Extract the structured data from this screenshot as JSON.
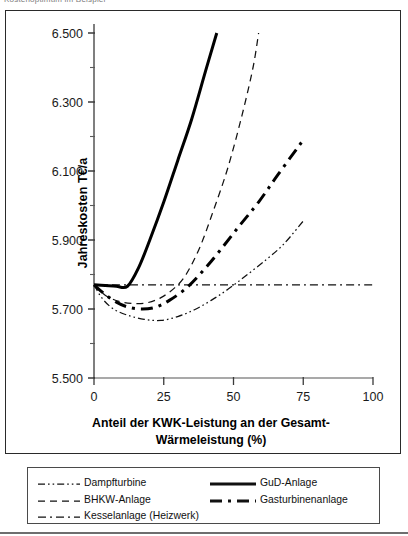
{
  "page": {
    "top_fragment": "Kostenoptimum im Beispiel"
  },
  "chart_data": {
    "type": "line",
    "title": "",
    "xlabel_line1": "Anteil der KWK-Leistung an der Gesamt-",
    "xlabel_line2": "Wärmeleistung (%)",
    "ylabel": "Jahreskosten T€/a",
    "xlim": [
      0,
      100
    ],
    "ylim": [
      5500,
      6500
    ],
    "xticks": [
      0,
      25,
      50,
      75,
      100
    ],
    "xtick_labels": [
      "0",
      "25",
      "50",
      "75",
      "100"
    ],
    "yticks": [
      5500,
      5700,
      5900,
      6100,
      6300,
      6500
    ],
    "ytick_labels": [
      "5.500",
      "5.700",
      "5.900",
      "6.100",
      "6.300",
      "6.500"
    ],
    "yticks_minor": [
      5600,
      5800,
      6000,
      6200,
      6400
    ],
    "grid": false,
    "legend_position": "below-plot",
    "series": [
      {
        "name": "Dampfturbine",
        "style": "dash-dot-dot",
        "width": "thin",
        "color": "#111111",
        "points": [
          [
            0,
            5770
          ],
          [
            3,
            5730
          ],
          [
            7,
            5700
          ],
          [
            12,
            5682
          ],
          [
            18,
            5670
          ],
          [
            24,
            5667
          ],
          [
            30,
            5678
          ],
          [
            36,
            5698
          ],
          [
            42,
            5725
          ],
          [
            48,
            5757
          ],
          [
            55,
            5800
          ],
          [
            62,
            5845
          ],
          [
            68,
            5888
          ],
          [
            75,
            5955
          ]
        ]
      },
      {
        "name": "BHKW-Anlage",
        "style": "dashed",
        "width": "thin",
        "color": "#111111",
        "points": [
          [
            0,
            5770
          ],
          [
            4,
            5740
          ],
          [
            9,
            5722
          ],
          [
            14,
            5716
          ],
          [
            19,
            5718
          ],
          [
            24,
            5733
          ],
          [
            29,
            5762
          ],
          [
            33,
            5800
          ],
          [
            38,
            5880
          ],
          [
            43,
            5990
          ],
          [
            48,
            6110
          ],
          [
            53,
            6260
          ],
          [
            57,
            6400
          ],
          [
            59,
            6500
          ]
        ]
      },
      {
        "name": "Kesselanlage (Heizwerk)",
        "style": "dash-dot",
        "width": "thin",
        "color": "#111111",
        "points": [
          [
            0,
            5770
          ],
          [
            25,
            5770
          ],
          [
            50,
            5770
          ],
          [
            75,
            5770
          ],
          [
            100,
            5770
          ]
        ]
      },
      {
        "name": "GuD-Anlage",
        "style": "solid",
        "width": "thick",
        "color": "#000000",
        "points": [
          [
            0,
            5770
          ],
          [
            4,
            5768
          ],
          [
            8,
            5766
          ],
          [
            12,
            5766
          ],
          [
            16,
            5820
          ],
          [
            20,
            5900
          ],
          [
            25,
            6010
          ],
          [
            30,
            6130
          ],
          [
            35,
            6250
          ],
          [
            40,
            6390
          ],
          [
            44,
            6500
          ]
        ]
      },
      {
        "name": "Gasturbinenanlage",
        "style": "dash-dot",
        "width": "thick",
        "color": "#000000",
        "points": [
          [
            0,
            5770
          ],
          [
            4,
            5742
          ],
          [
            8,
            5720
          ],
          [
            12,
            5706
          ],
          [
            17,
            5700
          ],
          [
            22,
            5705
          ],
          [
            27,
            5725
          ],
          [
            33,
            5760
          ],
          [
            39,
            5810
          ],
          [
            45,
            5868
          ],
          [
            52,
            5940
          ],
          [
            59,
            6010
          ],
          [
            66,
            6090
          ],
          [
            75,
            6190
          ]
        ]
      }
    ]
  },
  "legend": {
    "entries": [
      {
        "label": "Dampfturbine",
        "style": "dash-dot-dot",
        "width": "thin"
      },
      {
        "label": "GuD-Anlage",
        "style": "solid",
        "width": "thick"
      },
      {
        "label": "BHKW-Anlage",
        "style": "dashed",
        "width": "thin"
      },
      {
        "label": "Gasturbinenanlage",
        "style": "dash-dot",
        "width": "thick"
      },
      {
        "label": "Kesselanlage (Heizwerk)",
        "style": "dash-dot",
        "width": "thin"
      }
    ]
  }
}
